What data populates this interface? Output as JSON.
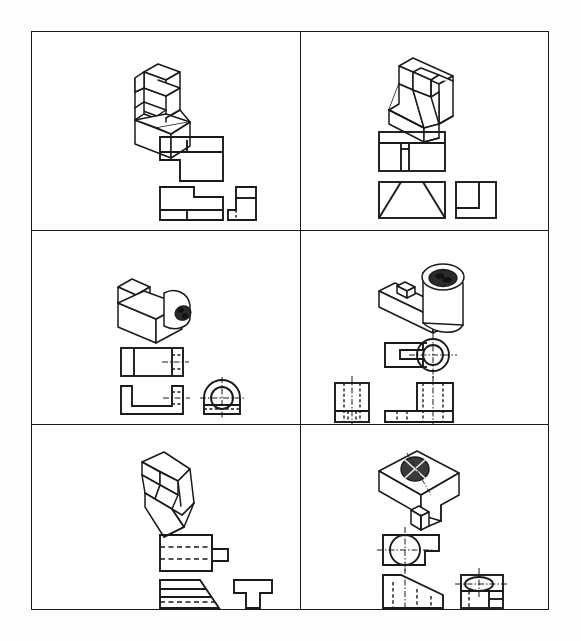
{
  "document": {
    "type": "engineering-drawing-worksheet",
    "title": "Isometric and Orthographic Projection Exercises",
    "line_color": "#1a1a1a",
    "background_color": "#ffffff",
    "hidden_line_style": "dashed",
    "center_line_style": "dash-dot",
    "border_width_px": 1.6,
    "layout": {
      "rows": 3,
      "columns": 2,
      "cell_count": 6
    }
  },
  "cells": [
    {
      "id": "cell-1",
      "row": 1,
      "column": 1,
      "name": "stepped-block-problem",
      "pictorial": {
        "name": "isometric-stepped-block",
        "description": "Stepped L-shaped block with raised tab, isometric view"
      },
      "views": [
        {
          "name": "top-view",
          "label": "",
          "features": "rectangle with notched lower-left corner and one vertical division line"
        },
        {
          "name": "front-view",
          "label": "",
          "features": "stepped profile with horizontal division near bottom"
        },
        {
          "name": "side-view",
          "label": "",
          "features": "small L profile with hidden dashed line"
        }
      ]
    },
    {
      "id": "cell-2",
      "row": 1,
      "column": 2,
      "name": "angled-wedge-problem",
      "pictorial": {
        "name": "isometric-angled-wedge-block",
        "description": "Block with inclined wedge surfaces and rear vertical wall, isometric view"
      },
      "views": [
        {
          "name": "top-view",
          "label": "",
          "features": "rectangle with inner T-shaped partition"
        },
        {
          "name": "front-view",
          "label": "",
          "features": "rectangle with two inclined lines forming trapezoid"
        },
        {
          "name": "side-view",
          "label": "",
          "features": "square with inner L step at lower right"
        }
      ]
    },
    {
      "id": "cell-3",
      "row": 2,
      "column": 1,
      "name": "bearing-bracket-problem",
      "pictorial": {
        "name": "isometric-bearing-bracket",
        "description": "U-channel base with semicircular end boss and through hole, isometric view"
      },
      "views": [
        {
          "name": "top-view",
          "label": "",
          "features": "rectangle with vertical divisions, hidden lines and horizontal center line at right"
        },
        {
          "name": "front-view",
          "label": "",
          "features": "L / U channel profile with hidden lines and center line at right"
        },
        {
          "name": "side-view",
          "label": "",
          "features": "semicircular boss over rectangular base with circular hole and cross center lines"
        }
      ]
    },
    {
      "id": "cell-4",
      "row": 2,
      "column": 2,
      "name": "slotted-hub-problem",
      "pictorial": {
        "name": "isometric-slotted-hub",
        "description": "Flat arm with open slot joined to cylindrical hub with bore, isometric view"
      },
      "views": [
        {
          "name": "top-view",
          "label": "",
          "features": "forked arm with rectangular slot and circular hub with concentric bore and cross center lines"
        },
        {
          "name": "side-view",
          "label": "",
          "features": "narrow rectangle with vertical hidden lines and vertical center line"
        },
        {
          "name": "front-view",
          "label": "",
          "features": "L shape with tall hub section, vertical hidden lines and center line"
        }
      ]
    },
    {
      "id": "cell-5",
      "row": 3,
      "column": 1,
      "name": "angled-notched-block-problem",
      "pictorial": {
        "name": "isometric-angled-notched-block",
        "description": "Angled prism with V notch cut into the front face, isometric view"
      },
      "views": [
        {
          "name": "top-view",
          "label": "",
          "features": "rectangle with projecting tab and two horizontal hidden lines"
        },
        {
          "name": "front-view",
          "label": "",
          "features": "trapezoid with inclined right edge, two solid and one hidden horizontal line"
        },
        {
          "name": "side-view",
          "label": "",
          "features": "inverted T profile"
        }
      ]
    },
    {
      "id": "cell-6",
      "row": 3,
      "column": 2,
      "name": "inclined-slotted-block-problem",
      "pictorial": {
        "name": "isometric-inclined-slotted-block",
        "description": "Block with inclined top face, through hole on the slope and central slot, isometric view"
      },
      "views": [
        {
          "name": "top-view",
          "label": "",
          "features": "rectangle with stepped right side, circular hole with cross center lines"
        },
        {
          "name": "front-view",
          "label": "",
          "features": "profile with sloping top edge and vertical hidden lines, vertical center line"
        },
        {
          "name": "side-view",
          "label": "",
          "features": "rectangle with ellipse at top, hidden vertical lines and horizontal center line"
        }
      ]
    }
  ]
}
